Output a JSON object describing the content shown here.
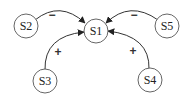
{
  "diagram": {
    "nodes": [
      {
        "id": "S1",
        "label": "S1",
        "x": 96,
        "y": 31
      },
      {
        "id": "S2",
        "label": "S2",
        "x": 26,
        "y": 26
      },
      {
        "id": "S3",
        "label": "S3",
        "x": 45,
        "y": 81
      },
      {
        "id": "S4",
        "label": "S4",
        "x": 150,
        "y": 80
      },
      {
        "id": "S5",
        "label": "S5",
        "x": 167,
        "y": 26
      }
    ],
    "edges": [
      {
        "from": "S2",
        "to": "S1",
        "sign": "−"
      },
      {
        "from": "S5",
        "to": "S1",
        "sign": "−"
      },
      {
        "from": "S3",
        "to": "S1",
        "sign": "+"
      },
      {
        "from": "S4",
        "to": "S1",
        "sign": "+"
      }
    ]
  }
}
